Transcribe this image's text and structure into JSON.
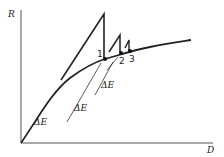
{
  "diagram": {
    "axes": {
      "y_label": "R",
      "x_label": "D"
    },
    "points": [
      {
        "label": "1"
      },
      {
        "label": "2"
      },
      {
        "label": "3"
      }
    ],
    "annotations": [
      {
        "label": "ΔE"
      },
      {
        "label": "ΔE"
      },
      {
        "label": "ΔE"
      }
    ],
    "colors": {
      "line": "#222222",
      "background": "#ffffff"
    }
  }
}
